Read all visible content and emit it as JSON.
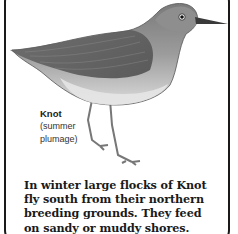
{
  "illustration": {
    "subject": "Knot bird in summer plumage",
    "colors": {
      "border": "#1a1a1a",
      "plumage_dark": "#555555",
      "plumage_light": "#bdbdbd",
      "belly": "#e4e4e4"
    }
  },
  "caption": {
    "name": "Knot",
    "line1": "(summer",
    "line2": "plumage)"
  },
  "description": {
    "lines": [
      "In winter large flocks of Knot",
      "fly south from their northern",
      "breeding grounds. They feed",
      "on sandy or muddy shores."
    ]
  }
}
